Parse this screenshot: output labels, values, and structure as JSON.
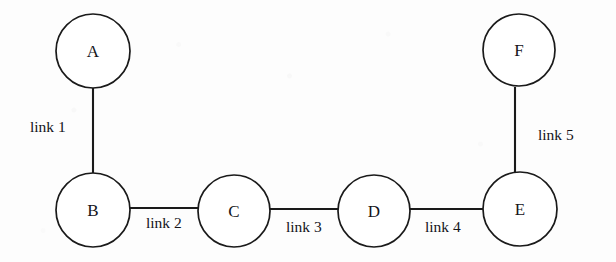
{
  "diagram": {
    "type": "node-link-graph",
    "background_color": "#fdfdfd",
    "stroke_color": "#1a1a1a",
    "node_fill": "#ffffff",
    "nodes": [
      {
        "id": "A",
        "label": "A",
        "cx": 93,
        "cy": 51,
        "rx": 37,
        "ry": 37
      },
      {
        "id": "B",
        "label": "B",
        "cx": 93,
        "cy": 210,
        "rx": 37,
        "ry": 37
      },
      {
        "id": "C",
        "label": "C",
        "cx": 234,
        "cy": 211,
        "rx": 36,
        "ry": 36
      },
      {
        "id": "D",
        "label": "D",
        "cx": 374,
        "cy": 211,
        "rx": 36,
        "ry": 36
      },
      {
        "id": "E",
        "label": "E",
        "cx": 520,
        "cy": 209,
        "rx": 37,
        "ry": 37
      },
      {
        "id": "F",
        "label": "F",
        "cx": 519,
        "cy": 50,
        "rx": 36,
        "ry": 36
      }
    ],
    "edges": [
      {
        "id": "link1",
        "label": "link 1",
        "from": "A",
        "to": "B",
        "x1": 93,
        "y1": 88,
        "x2": 93,
        "y2": 173,
        "label_x": 30,
        "label_y": 119,
        "orientation": "vertical"
      },
      {
        "id": "link2",
        "label": "link 2",
        "from": "B",
        "to": "C",
        "x1": 130,
        "y1": 208,
        "x2": 200,
        "y2": 208,
        "label_x": 146,
        "label_y": 215,
        "orientation": "horizontal"
      },
      {
        "id": "link3",
        "label": "link 3",
        "from": "C",
        "to": "D",
        "x1": 270,
        "y1": 209,
        "x2": 340,
        "y2": 209,
        "label_x": 286,
        "label_y": 219,
        "orientation": "horizontal"
      },
      {
        "id": "link4",
        "label": "link 4",
        "from": "D",
        "to": "E",
        "x1": 410,
        "y1": 209,
        "x2": 484,
        "y2": 209,
        "label_x": 425,
        "label_y": 219,
        "orientation": "horizontal"
      },
      {
        "id": "link5",
        "label": "link 5",
        "from": "F",
        "to": "E",
        "x1": 515,
        "y1": 87,
        "x2": 515,
        "y2": 172,
        "label_x": 538,
        "label_y": 127,
        "orientation": "vertical"
      }
    ]
  }
}
